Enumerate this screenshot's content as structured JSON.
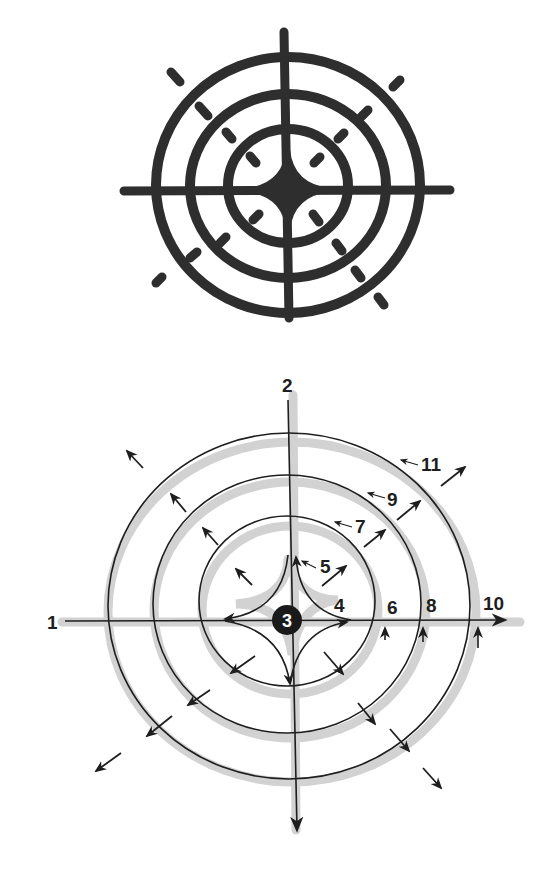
{
  "figure": {
    "colors": {
      "ink": "#2b2b2b",
      "line": "#1e1e1e",
      "halo": "#d2d2d2",
      "background": "#ffffff"
    }
  },
  "top_symbol": {
    "name": "painted-concentric-symbol",
    "rings": 3,
    "has_cross": true,
    "has_center_diamond": true,
    "radial_dash_count": 12
  },
  "schematic": {
    "labels": {
      "l1": "1",
      "l2": "2",
      "l3": "3",
      "l4": "4",
      "l5": "5",
      "l6": "6",
      "l7": "7",
      "l8": "8",
      "l9": "9",
      "l10": "10",
      "l11": "11"
    },
    "rings": 3,
    "outward_arrow_count": 15
  }
}
